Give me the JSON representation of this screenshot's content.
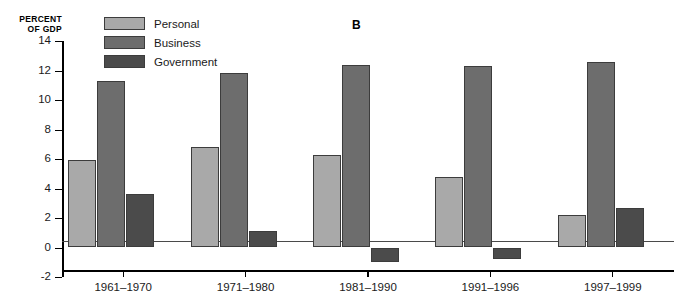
{
  "panel_label": "B",
  "axis_title_lines": [
    "PERCENT",
    "OF GDP"
  ],
  "legend": {
    "items": [
      {
        "label": "Personal",
        "color": "#a9a9a9",
        "key": "personal"
      },
      {
        "label": "Business",
        "color": "#6d6d6d",
        "key": "business"
      },
      {
        "label": "Government",
        "color": "#4b4b4b",
        "key": "government"
      }
    ]
  },
  "chart_data": {
    "type": "bar",
    "title": "B",
    "xlabel": "",
    "ylabel": "PERCENT OF GDP",
    "ylim": [
      -2,
      14
    ],
    "ytick_values": [
      -2,
      0,
      2,
      4,
      6,
      8,
      10,
      12,
      14
    ],
    "ytick_labels": [
      "-2",
      "0",
      "2",
      "4",
      "6",
      "8",
      "10",
      "12",
      "14"
    ],
    "grid": false,
    "legend_position": "top-left",
    "categories": [
      "1961–1970",
      "1971–1980",
      "1981–1990",
      "1991–1996",
      "1997–1999"
    ],
    "series": [
      {
        "name": "Personal",
        "color": "#a9a9a9",
        "values": [
          5.9,
          6.8,
          6.3,
          4.8,
          2.2
        ]
      },
      {
        "name": "Business",
        "color": "#6d6d6d",
        "values": [
          11.3,
          11.8,
          12.4,
          12.3,
          12.6
        ]
      },
      {
        "name": "Government",
        "color": "#4b4b4b",
        "values": [
          3.6,
          1.1,
          -1.0,
          -0.8,
          2.7
        ]
      }
    ]
  }
}
